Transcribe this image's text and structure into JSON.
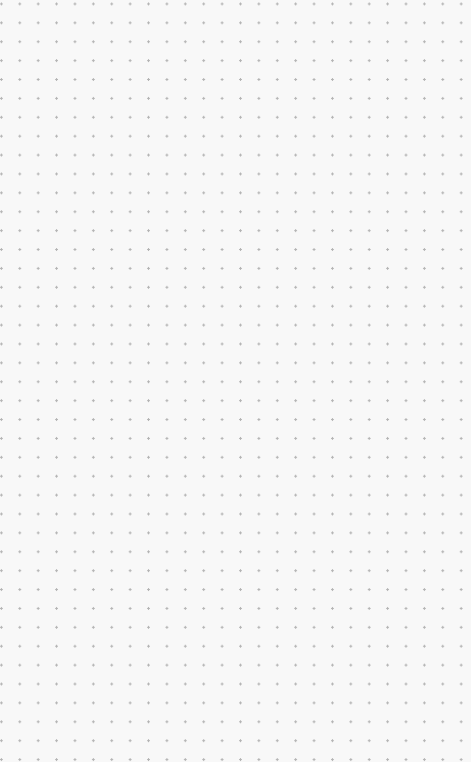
{
  "canvas": {
    "pattern": "dot-grid",
    "background_color": "#f8f8f8",
    "dot_color": "#b4b4b4",
    "dot_spacing_x": 18.4,
    "dot_spacing_y": 18.9
  }
}
